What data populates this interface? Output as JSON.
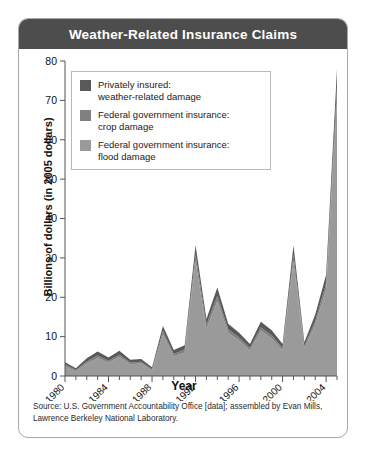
{
  "card": {
    "title": "Weather-Related Insurance Claims",
    "source_line1": "Source: U.S. Government Accountability Office [data]; assembled by Evan Mills,",
    "source_line2": "Lawrence Berkeley National Laboratory."
  },
  "legend": {
    "items": [
      {
        "label_line1": "Privately insured:",
        "label_line2": "weather-related damage",
        "color": "#595959"
      },
      {
        "label_line1": "Federal government insurance:",
        "label_line2": "crop damage",
        "color": "#808080"
      },
      {
        "label_line1": "Federal government insurance:",
        "label_line2": "flood damage",
        "color": "#9a9a9a"
      }
    ]
  },
  "chart_data": {
    "type": "area",
    "title": "Weather-Related Insurance Claims",
    "xlabel": "Year",
    "ylabel": "Billions of dollars (in 2005 dollars)",
    "xlim": [
      1980,
      2005
    ],
    "ylim": [
      0,
      80
    ],
    "yticks": [
      0,
      10,
      20,
      30,
      40,
      50,
      60,
      70,
      80
    ],
    "xticks": [
      1980,
      1984,
      1988,
      1992,
      1996,
      2000,
      2004
    ],
    "xtick_labels": [
      "1980",
      "1984",
      "1988",
      "1992",
      "1996",
      "2000",
      "2004"
    ],
    "grid": false,
    "stacked": true,
    "legend_position": "inside-top-left",
    "x": [
      1980,
      1981,
      1982,
      1983,
      1984,
      1985,
      1986,
      1987,
      1988,
      1989,
      1990,
      1991,
      1992,
      1993,
      1994,
      1995,
      1996,
      1997,
      1998,
      1999,
      2000,
      2001,
      2002,
      2003,
      2004,
      2005
    ],
    "series": [
      {
        "name": "Federal government insurance: flood damage",
        "color": "#9a9a9a",
        "values": [
          2.5,
          1.2,
          3.2,
          4.6,
          3.4,
          4.8,
          3.0,
          3.2,
          1.4,
          10.5,
          5.0,
          6.0,
          29.0,
          12.0,
          19.0,
          11.0,
          9.0,
          6.5,
          11.5,
          9.5,
          6.5,
          29.0,
          7.0,
          13.0,
          22.0,
          70.0
        ]
      },
      {
        "name": "Federal government insurance: crop damage",
        "color": "#808080",
        "values": [
          0.4,
          0.3,
          0.5,
          0.6,
          0.5,
          0.6,
          0.4,
          0.4,
          0.3,
          0.9,
          0.6,
          0.7,
          1.8,
          1.0,
          1.4,
          0.9,
          0.8,
          0.6,
          0.9,
          0.8,
          0.6,
          1.8,
          0.6,
          1.0,
          1.5,
          3.5
        ]
      },
      {
        "name": "Privately insured: weather-related damage",
        "color": "#595959",
        "values": [
          0.6,
          0.5,
          0.8,
          1.0,
          0.8,
          1.0,
          0.7,
          0.7,
          0.5,
          1.3,
          1.0,
          1.1,
          2.4,
          1.5,
          2.1,
          1.4,
          1.2,
          1.0,
          1.4,
          1.3,
          1.0,
          2.4,
          1.0,
          1.6,
          2.2,
          4.5
        ]
      }
    ]
  }
}
